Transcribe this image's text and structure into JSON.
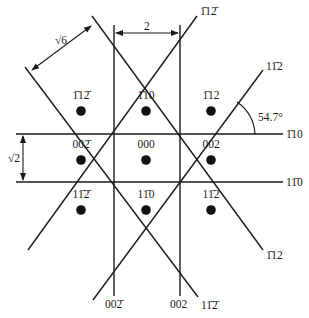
{
  "diagram": {
    "spots": [
      {
        "h": "1̄",
        "k": "1",
        "l": "2̄",
        "label": "1̄12̄",
        "row": 0,
        "col": 0
      },
      {
        "h": "1̄",
        "k": "1",
        "l": "0",
        "label": "1̄10",
        "row": 0,
        "col": 1
      },
      {
        "h": "1̄",
        "k": "1",
        "l": "2",
        "label": "1̄12",
        "row": 0,
        "col": 2
      },
      {
        "label": "002̄",
        "row": 1,
        "col": 0
      },
      {
        "label": "000",
        "row": 1,
        "col": 1
      },
      {
        "label": "002",
        "row": 1,
        "col": 2
      },
      {
        "label": "11̄2̄",
        "row": 2,
        "col": 0
      },
      {
        "label": "11̄0",
        "row": 2,
        "col": 1
      },
      {
        "label": "11̄2",
        "row": 2,
        "col": 2
      }
    ],
    "line_labels": {
      "top_up_right": "1̄12̄",
      "right_up_right": "11̄2",
      "horizontal_top": "1̄10",
      "horizontal_bottom": "11̄0",
      "right_down_right": "1̄12",
      "bottom_down_right": "11̄2̄",
      "vertical_right": "002",
      "vertical_left": "002̄"
    },
    "dimensions": {
      "vertical_spacing": "2",
      "horizontal_spacing": "√2",
      "diagonal_spacing": "√6",
      "angle": "54.7°"
    }
  }
}
